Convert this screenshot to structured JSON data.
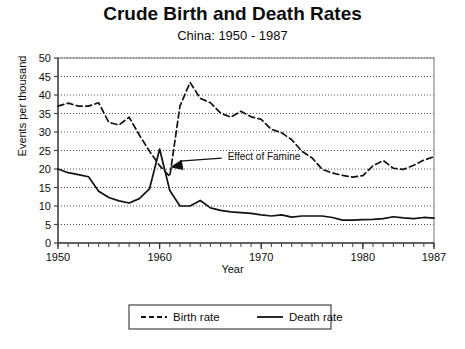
{
  "chart_data": {
    "type": "line",
    "title": "Crude Birth and Death Rates",
    "subtitle": "China: 1950 - 1987",
    "xlabel": "Year",
    "ylabel": "Events per thousand",
    "xlim": [
      1950,
      1987
    ],
    "ylim": [
      0,
      50
    ],
    "ytick_step": 5,
    "yticks": [
      "0",
      "5",
      "10",
      "15",
      "20",
      "25",
      "30",
      "35",
      "40",
      "45",
      "50"
    ],
    "xticks": [
      "1950",
      "1960",
      "1970",
      "1980",
      "1987"
    ],
    "xtick_values": [
      1950,
      1960,
      1970,
      1980,
      1987
    ],
    "minor_xtick_interval": 1,
    "grid": "horizontal-dotted",
    "legend_position": "bottom-center",
    "x": [
      1950,
      1951,
      1952,
      1953,
      1954,
      1955,
      1956,
      1957,
      1958,
      1959,
      1960,
      1961,
      1962,
      1963,
      1964,
      1965,
      1966,
      1967,
      1968,
      1969,
      1970,
      1971,
      1972,
      1973,
      1974,
      1975,
      1976,
      1977,
      1978,
      1979,
      1980,
      1981,
      1982,
      1983,
      1984,
      1985,
      1986,
      1987
    ],
    "series": [
      {
        "name": "Birth rate",
        "style": "dashed",
        "color": "#111111",
        "values": [
          37.0,
          37.8,
          37.0,
          37.0,
          37.9,
          32.6,
          31.9,
          34.0,
          29.2,
          24.8,
          20.9,
          18.0,
          37.0,
          43.4,
          39.1,
          37.9,
          35.1,
          34.0,
          35.6,
          34.1,
          33.4,
          30.7,
          29.8,
          27.9,
          24.8,
          23.0,
          19.9,
          18.9,
          18.3,
          17.8,
          18.2,
          20.9,
          22.3,
          20.2,
          19.9,
          21.0,
          22.4,
          23.3
        ]
      },
      {
        "name": "Death rate",
        "style": "solid",
        "color": "#111111",
        "values": [
          20.0,
          19.0,
          18.5,
          17.9,
          14.0,
          12.3,
          11.4,
          10.8,
          12.0,
          14.6,
          25.4,
          14.2,
          10.0,
          10.0,
          11.5,
          9.5,
          8.8,
          8.4,
          8.2,
          8.0,
          7.6,
          7.3,
          7.6,
          7.0,
          7.3,
          7.3,
          7.3,
          6.9,
          6.2,
          6.2,
          6.3,
          6.4,
          6.6,
          7.1,
          6.8,
          6.6,
          6.9,
          6.7
        ]
      }
    ],
    "annotations": [
      {
        "text": "Effect of Famine",
        "target_x": 1961,
        "target_y": 20.5,
        "label_x": 1966.5,
        "label_y": 23.5
      }
    ],
    "legend": [
      {
        "label": "Birth rate",
        "style": "dashed"
      },
      {
        "label": "Death rate",
        "style": "solid"
      }
    ]
  }
}
